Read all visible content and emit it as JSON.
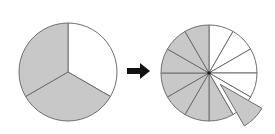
{
  "diagram": {
    "colors": {
      "filled": "#c8c8c8",
      "empty": "#ffffff",
      "stroke": "#6e6e6e",
      "arrow": "#111111"
    },
    "left_pie": {
      "cx": 68,
      "cy": 72,
      "r": 49,
      "parts": 3,
      "shaded": [
        1,
        2
      ]
    },
    "arrow": {
      "direction": "right"
    },
    "right_pie": {
      "cx": 209,
      "cy": 73,
      "r": 48,
      "parts": 12,
      "shaded": [
        5,
        6,
        7,
        8,
        9,
        10,
        11
      ],
      "extracted": 4,
      "extracted_offset": 16
    }
  }
}
